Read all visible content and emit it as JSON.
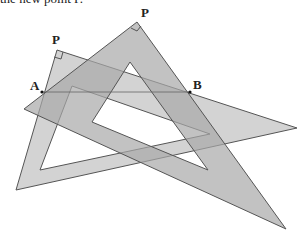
{
  "caption": "the new point P.",
  "labels": {
    "p_left": "P",
    "p_right": "P",
    "a": "A",
    "b": "B"
  },
  "colors": {
    "set_square_fill": "#b0b0b0",
    "set_square_fill_light": "#c8c8c8",
    "edge": "#555555",
    "cutout": "#ffffff",
    "line_ab": "#666666"
  },
  "geometry": {
    "set_square_1": {
      "right_angle_vertex": [
        137,
        22
      ],
      "vertices": [
        [
          137,
          22
        ],
        [
          24,
          109
        ],
        [
          286,
          229
        ]
      ]
    },
    "set_square_2": {
      "right_angle_vertex": [
        57,
        50
      ],
      "vertices": [
        [
          57,
          50
        ],
        [
          16,
          190
        ],
        [
          297,
          128
        ]
      ]
    },
    "point_a": [
      42,
      92
    ],
    "point_b": [
      190,
      92
    ]
  }
}
